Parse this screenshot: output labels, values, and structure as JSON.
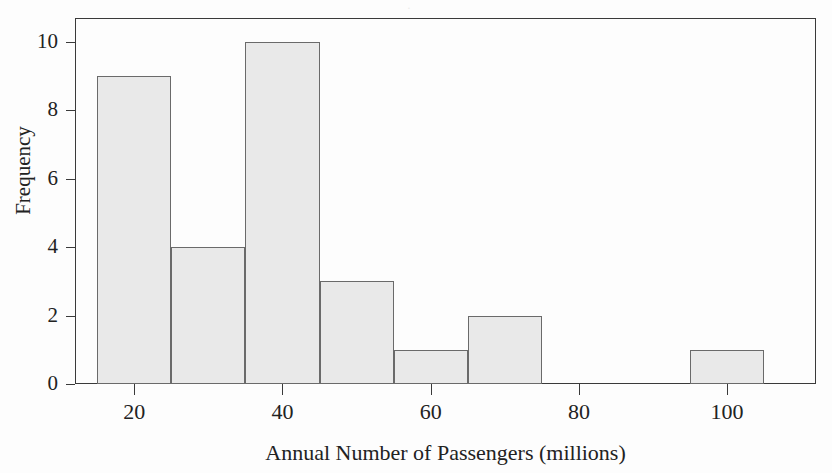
{
  "figure": {
    "background_color": "#fdfdfd",
    "bar_fill_color": "#e9e9e9",
    "bar_edge_color": "#6a6a6a",
    "axis_color": "#3a3a3a",
    "bleed_through_text": "·"
  },
  "chart_data": {
    "type": "bar",
    "chart_subtype": "histogram",
    "title": "",
    "xlabel": "Annual Number of Passengers (millions)",
    "ylabel": "Frequency",
    "xlim": [
      12,
      112
    ],
    "ylim": [
      0,
      10.7
    ],
    "grid": false,
    "legend": null,
    "bin_width": 10,
    "bin_edges": [
      15,
      25,
      35,
      45,
      55,
      65,
      75,
      85,
      95,
      105
    ],
    "categories": [
      "15-25",
      "25-35",
      "35-45",
      "45-55",
      "55-65",
      "65-75",
      "75-85",
      "85-95",
      "95-105"
    ],
    "values": [
      9,
      4,
      10,
      3,
      1,
      2,
      0,
      0,
      1
    ],
    "bins": [
      {
        "label": "15-25",
        "start": 15,
        "end": 25,
        "frequency": 9
      },
      {
        "label": "25-35",
        "start": 25,
        "end": 35,
        "frequency": 4
      },
      {
        "label": "35-45",
        "start": 35,
        "end": 45,
        "frequency": 10
      },
      {
        "label": "45-55",
        "start": 45,
        "end": 55,
        "frequency": 3
      },
      {
        "label": "55-65",
        "start": 55,
        "end": 65,
        "frequency": 1
      },
      {
        "label": "65-75",
        "start": 65,
        "end": 75,
        "frequency": 2
      },
      {
        "label": "75-85",
        "start": 75,
        "end": 85,
        "frequency": 0
      },
      {
        "label": "85-95",
        "start": 85,
        "end": 95,
        "frequency": 0
      },
      {
        "label": "95-105",
        "start": 95,
        "end": 105,
        "frequency": 1
      }
    ],
    "xticks": [
      20,
      40,
      60,
      80,
      100
    ],
    "xtick_labels": [
      "20",
      "40",
      "60",
      "80",
      "100"
    ],
    "yticks": [
      0,
      2,
      4,
      6,
      8,
      10
    ],
    "ytick_labels": [
      "0",
      "2",
      "4",
      "6",
      "8",
      "10"
    ],
    "total_count": 30
  }
}
